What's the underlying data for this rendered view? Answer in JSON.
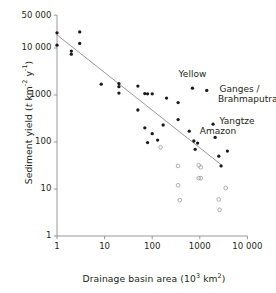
{
  "figure": {
    "background": "#ffffff",
    "ink_color": "#231f20",
    "axis_color": "#8d8d8d",
    "marker_fill": "#1a1a1a",
    "open_marker_stroke": "#9b9b9b",
    "trend_color": "#8d8d8d"
  },
  "axes": {
    "x": {
      "label_prefix": "Drainage basin area (10",
      "label_exponent": "3",
      "label_mid": " km",
      "label_exponent2": "2",
      "label_suffix": ")",
      "ticks": [
        "1",
        "10",
        "100",
        "1000",
        "10 000"
      ],
      "tick_values": [
        1,
        10,
        100,
        1000,
        10000
      ],
      "scale": "log",
      "range": [
        1,
        10000
      ]
    },
    "y": {
      "label_prefix": "Sediment yield (",
      "label_italic": "t",
      "label_mid": " km",
      "label_exponent": "-2",
      "label_mid2": " y",
      "label_exponent2": "-1",
      "label_suffix": ")",
      "ticks": [
        "50 000",
        "10 000",
        "1000",
        "100",
        "10",
        "1"
      ],
      "tick_values": [
        50000,
        10000,
        1000,
        100,
        10,
        1
      ],
      "scale": "log",
      "range": [
        1,
        50000
      ]
    }
  },
  "annotations": [
    {
      "text": "Yellow",
      "x": 700,
      "y": 2600,
      "align": "center"
    },
    {
      "text": "Ganges /",
      "x": 2600,
      "y": 1250,
      "align": "left"
    },
    {
      "text": "Brahmaputra",
      "x": 2400,
      "y": 800,
      "align": "left"
    },
    {
      "text": "Yangtze",
      "x": 2600,
      "y": 260,
      "align": "left"
    },
    {
      "text": "Amazon",
      "x": 1000,
      "y": 160,
      "align": "left"
    }
  ],
  "chart_data": {
    "type": "scatter",
    "title": "",
    "xlabel": "Drainage basin area (10^3 km^2)",
    "ylabel": "Sediment yield (t km^-2 y^-1)",
    "xscale": "log",
    "yscale": "log",
    "xlim": [
      1,
      10000
    ],
    "ylim": [
      1,
      50000
    ],
    "grid": false,
    "legend": "none",
    "series": [
      {
        "name": "Sediment yield (filled circles)",
        "marker": "filled-circle",
        "points": [
          [
            1.0,
            21000
          ],
          [
            1.0,
            11500
          ],
          [
            2.0,
            8600
          ],
          [
            2.0,
            7400
          ],
          [
            3.0,
            22000
          ],
          [
            3.0,
            12500
          ],
          [
            8.5,
            1700
          ],
          [
            20,
            1750
          ],
          [
            20,
            1500
          ],
          [
            20,
            1100
          ],
          [
            50,
            1550
          ],
          [
            50,
            480
          ],
          [
            70,
            1070
          ],
          [
            70,
            200
          ],
          [
            80,
            1060
          ],
          [
            80,
            97
          ],
          [
            100,
            1060
          ],
          [
            100,
            150
          ],
          [
            130,
            110
          ],
          [
            170,
            230
          ],
          [
            200,
            860
          ],
          [
            350,
            690
          ],
          [
            350,
            300
          ],
          [
            600,
            170
          ],
          [
            700,
            1400
          ],
          [
            750,
            105
          ],
          [
            800,
            70
          ],
          [
            900,
            95
          ],
          [
            1400,
            1250
          ],
          [
            1900,
            240
          ],
          [
            2100,
            125
          ],
          [
            2500,
            50
          ],
          [
            2800,
            31
          ],
          [
            3800,
            64
          ]
        ]
      },
      {
        "name": "Sediment yield (open circles)",
        "marker": "open-circle",
        "points": [
          [
            150,
            77
          ],
          [
            350,
            31
          ],
          [
            350,
            12
          ],
          [
            380,
            5.8
          ],
          [
            950,
            32
          ],
          [
            1050,
            29
          ],
          [
            950,
            17
          ],
          [
            1050,
            17
          ],
          [
            2500,
            6.0
          ],
          [
            2600,
            3.6
          ],
          [
            3500,
            10.5
          ]
        ]
      }
    ],
    "trend_line": {
      "name": "regression line",
      "x_start": 1.0,
      "y_start": 19000,
      "x_end": 2800,
      "y_end": 33
    }
  }
}
